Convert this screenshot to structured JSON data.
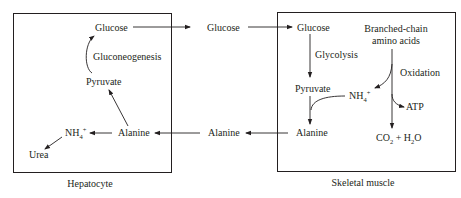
{
  "diagram": {
    "compartments": {
      "hepatocyte": {
        "label": "Hepatocyte",
        "nodes": {
          "glucose": "Glucose",
          "gluconeogenesis": "Gluconeogenesis",
          "pyruvate": "Pyruvate",
          "alanine": "Alanine",
          "nh4": "NH",
          "nh4_sub": "4",
          "nh4_sup": "+",
          "urea": "Urea"
        }
      },
      "blood": {
        "nodes": {
          "glucose": "Glucose",
          "alanine": "Alanine"
        }
      },
      "skeletal_muscle": {
        "label": "Skeletal muscle",
        "nodes": {
          "glucose": "Glucose",
          "glycolysis": "Glycolysis",
          "pyruvate": "Pyruvate",
          "alanine": "Alanine",
          "bcaa_line1": "Branched-chain",
          "bcaa_line2": "amino acids",
          "oxidation": "Oxidation",
          "nh4": "NH",
          "nh4_sub": "4",
          "nh4_sup": "+",
          "atp": "ATP",
          "co2": "CO",
          "co2_sub": "2",
          "plus": " + H",
          "h2o_sub": "2",
          "h2o_o": "O"
        }
      }
    },
    "edges": [
      {
        "from": "hepatocyte.glucose",
        "to": "blood.glucose"
      },
      {
        "from": "blood.glucose",
        "to": "skeletal_muscle.glucose"
      },
      {
        "from": "skeletal_muscle.glucose",
        "to": "skeletal_muscle.pyruvate",
        "label": "Glycolysis"
      },
      {
        "from": "skeletal_muscle.pyruvate",
        "to": "skeletal_muscle.alanine"
      },
      {
        "from": "skeletal_muscle.nh4",
        "to": "skeletal_muscle.alanine"
      },
      {
        "from": "skeletal_muscle.bcaa",
        "to": "skeletal_muscle.nh4",
        "label": "Oxidation"
      },
      {
        "from": "skeletal_muscle.bcaa",
        "to": "skeletal_muscle.atp"
      },
      {
        "from": "skeletal_muscle.bcaa",
        "to": "skeletal_muscle.co2_h2o"
      },
      {
        "from": "skeletal_muscle.alanine",
        "to": "blood.alanine"
      },
      {
        "from": "blood.alanine",
        "to": "hepatocyte.alanine"
      },
      {
        "from": "hepatocyte.alanine",
        "to": "hepatocyte.pyruvate"
      },
      {
        "from": "hepatocyte.alanine",
        "to": "hepatocyte.nh4"
      },
      {
        "from": "hepatocyte.nh4",
        "to": "hepatocyte.urea"
      },
      {
        "from": "hepatocyte.pyruvate",
        "to": "hepatocyte.glucose",
        "label": "Gluconeogenesis"
      }
    ],
    "colors": {
      "ink": "#231f20",
      "background": "#ffffff"
    }
  }
}
